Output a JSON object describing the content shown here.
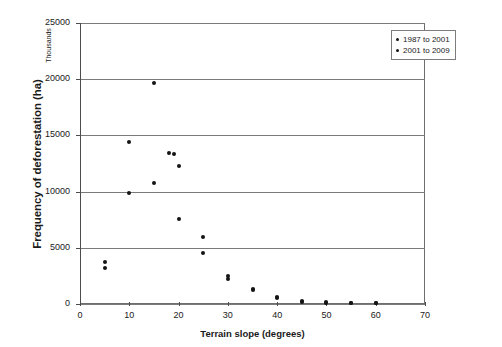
{
  "chart_data": {
    "type": "scatter",
    "title": "",
    "xlabel": "Terrain slope (degrees)",
    "ylabel": "Frequency of deforestation (ha)",
    "y_unit_note": "Thousands",
    "xlim": [
      0,
      70
    ],
    "ylim": [
      0,
      25000
    ],
    "xticks": [
      0,
      10,
      20,
      30,
      40,
      50,
      60,
      70
    ],
    "yticks": [
      0,
      5000,
      10000,
      15000,
      20000,
      25000
    ],
    "xtick_labels": [
      "0",
      "10",
      "20",
      "30",
      "40",
      "50",
      "60",
      "70"
    ],
    "ytick_labels": [
      "0",
      "5000",
      "10000",
      "15000",
      "20000",
      "25000"
    ],
    "grid": "horizontal",
    "legend_position": "top-right",
    "series": [
      {
        "name": "1987 to 2001",
        "marker": "circle",
        "color": "#141414",
        "points": [
          {
            "x": 5,
            "y": 3700
          },
          {
            "x": 10,
            "y": 14400
          },
          {
            "x": 15,
            "y": 19650
          },
          {
            "x": 18,
            "y": 13400
          },
          {
            "x": 20,
            "y": 12300
          },
          {
            "x": 25,
            "y": 5950
          },
          {
            "x": 30,
            "y": 2500
          },
          {
            "x": 35,
            "y": 1300
          },
          {
            "x": 40,
            "y": 600
          },
          {
            "x": 45,
            "y": 250
          },
          {
            "x": 50,
            "y": 150
          },
          {
            "x": 55,
            "y": 120
          },
          {
            "x": 60,
            "y": 80
          }
        ]
      },
      {
        "name": "2001 to 2009",
        "marker": "circle",
        "color": "#141414",
        "points": [
          {
            "x": 5,
            "y": 3200
          },
          {
            "x": 10,
            "y": 9900
          },
          {
            "x": 15,
            "y": 10800
          },
          {
            "x": 19,
            "y": 13350
          },
          {
            "x": 20,
            "y": 7550
          },
          {
            "x": 25,
            "y": 4550
          },
          {
            "x": 30,
            "y": 2200
          },
          {
            "x": 35,
            "y": 1250
          },
          {
            "x": 40,
            "y": 500
          },
          {
            "x": 45,
            "y": 200
          },
          {
            "x": 50,
            "y": 110
          },
          {
            "x": 55,
            "y": 90
          },
          {
            "x": 60,
            "y": 60
          }
        ]
      }
    ]
  },
  "legend": {
    "items": [
      {
        "label": "1987 to 2001"
      },
      {
        "label": "2001 to 2009"
      }
    ]
  }
}
